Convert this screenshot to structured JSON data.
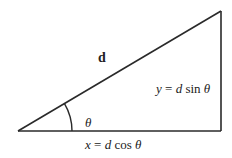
{
  "diagram": {
    "type": "right-triangle-vector-decomposition",
    "hypotenuse_label": "d",
    "angle_label": "θ",
    "opposite_side_label": {
      "var": "y",
      "eq": " = ",
      "mag": "d",
      "fn": " sin ",
      "angle": "θ"
    },
    "adjacent_side_label": {
      "var": "x",
      "eq": " = ",
      "mag": "d",
      "fn": " cos ",
      "angle": "θ"
    },
    "line_color": "#2a2a2a"
  }
}
